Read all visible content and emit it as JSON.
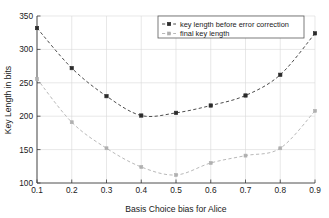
{
  "chart_data": {
    "type": "line",
    "title": "",
    "xlabel": "Basis Choice bias for Alice",
    "ylabel": "Key Length in bits",
    "x": [
      0.1,
      0.2,
      0.3,
      0.4,
      0.5,
      0.6,
      0.7,
      0.8,
      0.9
    ],
    "xtick_labels": [
      "0.1",
      "0.2",
      "0.3",
      "0.4",
      "0.5",
      "0.6",
      "0.7",
      "0.8",
      "0.9"
    ],
    "ytick_labels": [
      "100",
      "150",
      "200",
      "250",
      "300",
      "350"
    ],
    "yticks": [
      100,
      150,
      200,
      250,
      300,
      350
    ],
    "xlim": [
      0.1,
      0.9
    ],
    "ylim": [
      100,
      350
    ],
    "grid": true,
    "legend_position": "top-right",
    "series": [
      {
        "name": "key length before error correction",
        "color": "#2b2b2b",
        "marker": "square",
        "linestyle": "dashed",
        "values": [
          332,
          272,
          230,
          201,
          205,
          216,
          231,
          262,
          324
        ]
      },
      {
        "name": "final key length",
        "color": "#b0b0b0",
        "marker": "square",
        "linestyle": "dashed",
        "values": [
          256,
          191,
          152,
          124,
          112,
          130,
          141,
          152,
          208
        ]
      }
    ]
  },
  "axes": {
    "x_title": "Basis Choice bias for Alice",
    "y_title": "Key Length in bits"
  },
  "legend": {
    "entries": [
      {
        "label": "key length before error correction"
      },
      {
        "label": "final key length"
      }
    ]
  },
  "ticks": {
    "x": [
      "0.1",
      "0.2",
      "0.3",
      "0.4",
      "0.5",
      "0.6",
      "0.7",
      "0.8",
      "0.9"
    ],
    "y": [
      "350",
      "300",
      "250",
      "200",
      "150",
      "100"
    ]
  }
}
